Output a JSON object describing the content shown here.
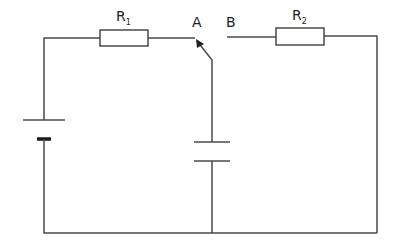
{
  "diagram": {
    "type": "circuit",
    "colors": {
      "wire": "#4a4a4a",
      "background": "#ffffff",
      "text": "#222222"
    },
    "components": {
      "resistor_1": {
        "label": "R",
        "subscript": "1"
      },
      "resistor_2": {
        "label": "R",
        "subscript": "2"
      },
      "switch": {
        "contact_a": "A",
        "contact_b": "B"
      },
      "battery": {
        "label": ""
      },
      "capacitor": {
        "label": ""
      }
    }
  }
}
